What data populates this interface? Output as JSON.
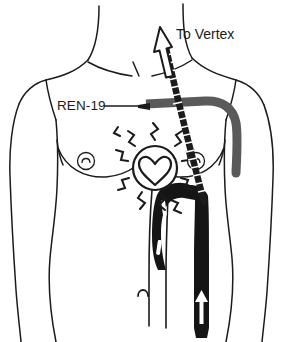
{
  "diagram": {
    "background_color": "#ffffff",
    "ink_color": "#1b1b1b",
    "accent_gray": "#5a5a5a",
    "width": 283,
    "height": 342
  },
  "labels": {
    "vertex": "To Vertex",
    "point": "REN-19"
  },
  "annotations": {
    "acupoint_name": "REN-19",
    "needle_description": "gray needle inserted at REN-19 on the sternum, shaft angled laterally",
    "propagation_arrow": "To Vertex",
    "heart_marker": "heart outline with radiating zigzag sensation lines",
    "vessel_marker": "great vessels shown solid black with white directional arrows",
    "navel_marker": "umbilicus"
  },
  "icons": {
    "arrow_up": "hollow-up-arrow-icon",
    "needle": "acupuncture-needle-icon",
    "heart": "heart-icon",
    "zigzag": "sensation-zigzag-icon",
    "navel": "navel-icon",
    "nipple": "nipple-icon",
    "vessel_arrow": "vessel-flow-arrow-icon"
  },
  "colors": {
    "outline": "#1b1b1b",
    "needle_gray": "#5a5a5a",
    "vessel_black": "#151515",
    "white": "#ffffff"
  }
}
